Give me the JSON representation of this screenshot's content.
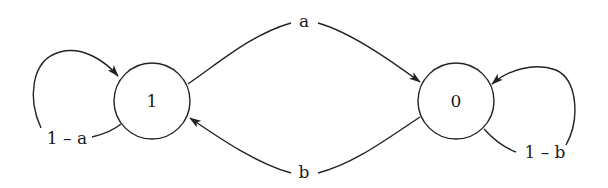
{
  "diagram": {
    "type": "state-transition-diagram",
    "nodes": [
      {
        "id": "1",
        "label": "1"
      },
      {
        "id": "0",
        "label": "0"
      }
    ],
    "edges": [
      {
        "from": "1",
        "to": "1",
        "label": "1 – a"
      },
      {
        "from": "1",
        "to": "0",
        "label": "a"
      },
      {
        "from": "0",
        "to": "1",
        "label": "b"
      },
      {
        "from": "0",
        "to": "0",
        "label": "1 – b"
      }
    ],
    "colors": {
      "stroke": "#222222",
      "text": "#1a1a1a",
      "background": "#ffffff"
    }
  }
}
